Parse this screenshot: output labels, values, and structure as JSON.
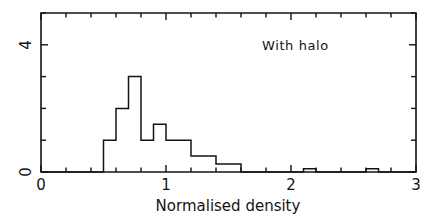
{
  "chart_data": {
    "type": "bar",
    "title": "",
    "annotation": "With halo",
    "xlabel": "Normalised density",
    "ylabel": "",
    "xlim": [
      0,
      3
    ],
    "ylim": [
      0,
      5
    ],
    "xticks": [
      0,
      1,
      2,
      3
    ],
    "xticklabels": [
      "0",
      "1",
      "2",
      "3"
    ],
    "yticks": [
      0,
      1,
      2,
      3,
      4,
      5
    ],
    "yticklabels_shown": [
      "0",
      "4"
    ],
    "ytick_label_values": [
      0,
      4
    ],
    "grid": false,
    "legend": null,
    "bin_width": 0.1,
    "bin_edges": [
      0.5,
      0.6,
      0.7,
      0.8,
      0.9,
      1.0,
      1.1,
      1.2,
      1.3,
      1.4,
      1.5,
      1.6,
      1.7,
      1.8,
      1.9,
      2.0,
      2.1,
      2.2,
      2.3,
      2.4,
      2.5,
      2.6,
      2.7,
      2.8
    ],
    "values": [
      1,
      2,
      3,
      1,
      1.5,
      1,
      1,
      0.5,
      0.5,
      0.25,
      0.25,
      0,
      0,
      0,
      0,
      0,
      0.1,
      0,
      0,
      0,
      0,
      0.1,
      0
    ],
    "categories": [
      "0.5-0.6",
      "0.6-0.7",
      "0.7-0.8",
      "0.8-0.9",
      "0.9-1.0",
      "1.0-1.1",
      "1.1-1.2",
      "1.2-1.3",
      "1.3-1.4",
      "1.4-1.5",
      "1.5-1.6",
      "1.6-1.7",
      "1.7-1.8",
      "1.8-1.9",
      "1.9-2.0",
      "2.0-2.1",
      "2.1-2.2",
      "2.2-2.3",
      "2.3-2.4",
      "2.4-2.5",
      "2.5-2.6",
      "2.6-2.7",
      "2.7-2.8"
    ]
  },
  "colors": {
    "line": "#141414",
    "axis": "#141414",
    "background": "#ffffff"
  },
  "xtick_labels": {
    "t0": "0",
    "t1": "1",
    "t2": "2",
    "t3": "3"
  },
  "ytick_labels": {
    "top": "4",
    "bottom": "0"
  },
  "texts": {
    "annotation": "With halo",
    "xaxis_title": "Normalised density"
  }
}
